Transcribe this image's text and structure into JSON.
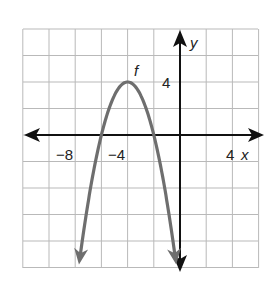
{
  "chart_data": {
    "type": "line",
    "title": "",
    "function_label": "f",
    "equation": "f(x) = -(x + 4)^2 + 4",
    "vertex": [
      -4,
      4
    ],
    "x_intercepts": [
      -6,
      -2
    ],
    "xlabel": "x",
    "ylabel": "y",
    "xlim": [
      -12,
      6
    ],
    "ylim": [
      -10,
      8
    ],
    "grid": true,
    "grid_step": 2,
    "x_tick_labels": [
      {
        "value": -8,
        "text": "−8"
      },
      {
        "value": -4,
        "text": "−4"
      },
      {
        "value": 4,
        "text": "4"
      }
    ],
    "y_tick_labels": [
      {
        "value": 4,
        "text": "4"
      }
    ],
    "series": [
      {
        "name": "f",
        "x": [
          -7.8,
          -7,
          -6,
          -5,
          -4,
          -3,
          -2,
          -1,
          -0.2
        ],
        "y": [
          -10.44,
          -5,
          0,
          3,
          4,
          3,
          0,
          -5,
          -10.44
        ]
      }
    ],
    "colors": {
      "curve": "#6e6e6e",
      "axes": "#111111",
      "grid": "#b9b9b9"
    }
  },
  "labels": {
    "x_axis": "x",
    "y_axis": "y",
    "func": "f",
    "tick_neg8": "−8",
    "tick_neg4": "−4",
    "tick_4x": "4",
    "tick_4y": "4"
  }
}
